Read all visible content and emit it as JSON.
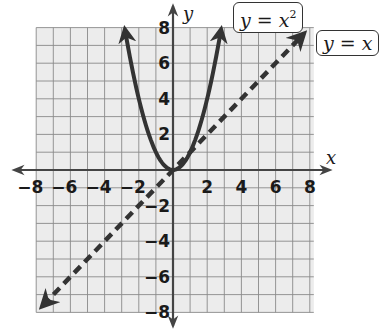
{
  "chart_data": {
    "type": "line",
    "title": "",
    "xlabel": "x",
    "ylabel": "y",
    "xlim": [
      -8,
      8
    ],
    "ylim": [
      -8,
      8
    ],
    "grid": true,
    "grid_step": 1,
    "x_ticks": [
      -8,
      -6,
      -4,
      -2,
      2,
      4,
      6,
      8
    ],
    "y_ticks": [
      8,
      6,
      4,
      2,
      -2,
      -4,
      -6,
      -8
    ],
    "x_tick_labels": [
      "−8",
      "−6",
      "−4",
      "−2",
      "2",
      "4",
      "6",
      "8"
    ],
    "y_tick_labels": [
      "8",
      "6",
      "4",
      "2",
      "−2",
      "−4",
      "−6",
      "−8"
    ],
    "series": [
      {
        "name": "y = x²",
        "style": "solid",
        "function": "x^2",
        "x": [
          -2.8,
          -2,
          -1,
          0,
          1,
          2,
          2.8
        ],
        "y": [
          7.84,
          4,
          1,
          0,
          1,
          4,
          7.84
        ]
      },
      {
        "name": "y = x",
        "style": "dashed",
        "function": "x",
        "x": [
          -7.6,
          -4,
          0,
          4,
          7.6
        ],
        "y": [
          -7.6,
          -4,
          0,
          4,
          7.6
        ]
      }
    ],
    "annotations": [
      {
        "text": "y = x²",
        "position": "top, above parabola"
      },
      {
        "text": "y = x",
        "position": "top-right, at end of dashed line"
      }
    ],
    "legend": "none (boxed labels)"
  },
  "labels": {
    "x_axis": "x",
    "y_axis": "y",
    "parabola_base": "y = x",
    "parabola_exp": "2",
    "line_eq": "y = x"
  },
  "colors": {
    "grid_bg": "#ececec",
    "grid_line": "#8a8a8a",
    "axis": "#444444",
    "curve": "#333333"
  }
}
